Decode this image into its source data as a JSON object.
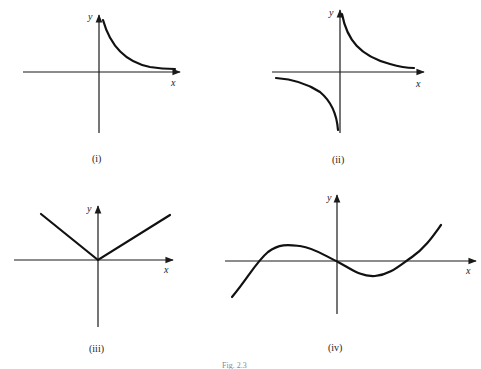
{
  "figure": {
    "caption": "Fig. 2.3",
    "panels": [
      {
        "id": "i",
        "label": "(i)",
        "x_axis": "x",
        "y_axis": "y",
        "description": "Branch of rectangular hyperbola in first quadrant only, decaying toward x-axis"
      },
      {
        "id": "ii",
        "label": "(ii)",
        "x_axis": "x",
        "y_axis": "y",
        "description": "Rectangular hyperbola y = 1/x with branches in first and third quadrants"
      },
      {
        "id": "iii",
        "label": "(iii)",
        "x_axis": "x",
        "y_axis": "y",
        "description": "V-shaped absolute value-like graph with vertex at origin"
      },
      {
        "id": "iv",
        "label": "(iv)",
        "x_axis": "x",
        "y_axis": "y",
        "description": "Cubic curve crossing x-axis at three points including origin"
      }
    ]
  }
}
